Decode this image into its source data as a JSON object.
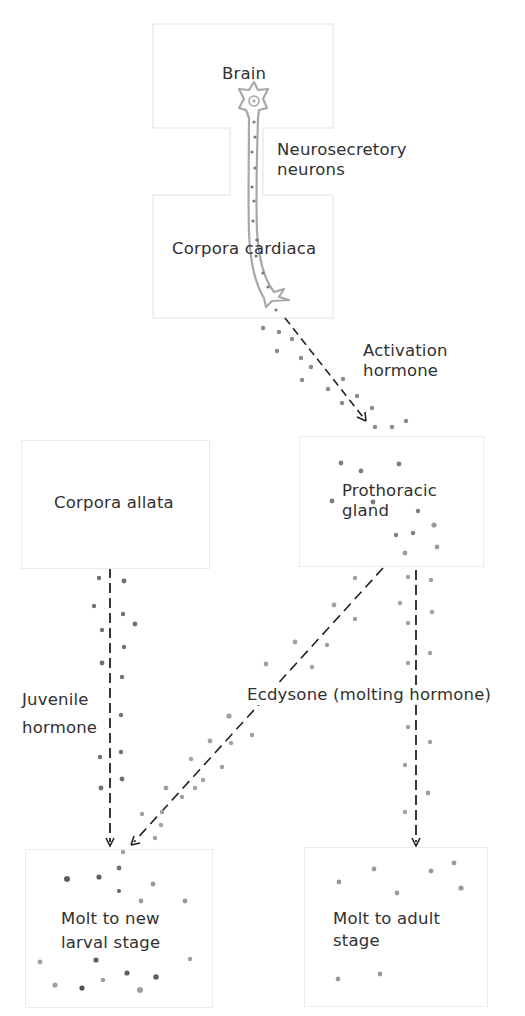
{
  "diagram": {
    "type": "hormonal-control-flow",
    "nodes": {
      "brain": {
        "label": "Brain"
      },
      "corpora_cardiaca": {
        "label": "Corpora cardiaca"
      },
      "corpora_allata": {
        "label": "Corpora allata"
      },
      "prothoracic_gland": {
        "line1": "Prothoracic",
        "line2": "gland"
      },
      "molt_larval": {
        "line1": "Molt to new",
        "line2": "larval stage"
      },
      "molt_adult": {
        "line1": "Molt to adult",
        "line2": "stage"
      }
    },
    "labels": {
      "neurosecretory": {
        "line1": "Neurosecretory",
        "line2": "neurons"
      },
      "activation": {
        "line1": "Activation",
        "line2": "hormone"
      },
      "juvenile": {
        "line1": "Juvenile",
        "line2": "hormone"
      },
      "ecdysone": "Ecdysone (molting hormone)"
    },
    "edges": [
      {
        "from": "Corpora cardiaca",
        "to": "Prothoracic gland",
        "label": "Activation hormone"
      },
      {
        "from": "Corpora allata",
        "to": "Molt to new larval stage",
        "label": "Juvenile hormone"
      },
      {
        "from": "Prothoracic gland",
        "to": "Molt to new larval stage",
        "label": "Ecdysone (molting hormone)"
      },
      {
        "from": "Prothoracic gland",
        "to": "Molt to adult stage",
        "label": "Ecdysone (molting hormone)"
      }
    ],
    "colors": {
      "box_border": "#ececec",
      "neuron_outline": "#a8a8a8",
      "arrow": "#222222",
      "dot_dark": "#6e6e6e",
      "dot_light": "#a2a2a2"
    }
  }
}
